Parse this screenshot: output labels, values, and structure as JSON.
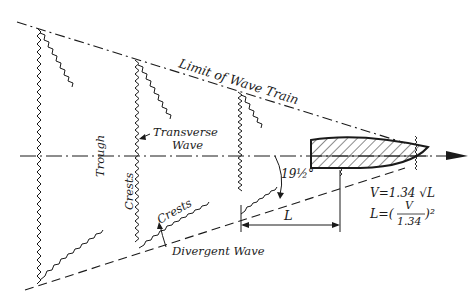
{
  "diagram": {
    "labels": {
      "limit": "Limit of Wave Train",
      "transverse_line1": "Transverse",
      "transverse_line2": "Wave",
      "trough": "Trough",
      "crests_vertical": "Crests",
      "crests_diagonal": "Crests",
      "divergent": "Divergent Wave",
      "angle": "19½°",
      "length": "L",
      "formula_speed": "V=1.34 √L",
      "formula_length_prefix": "L=(",
      "formula_length_num": "V",
      "formula_length_den": "1.34",
      "formula_length_suffix": ")²"
    },
    "colors": {
      "ink": "#1a1a1a",
      "background": "#ffffff"
    }
  }
}
